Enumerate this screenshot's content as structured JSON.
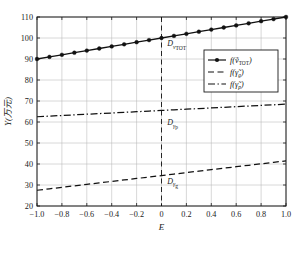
{
  "chart_data": {
    "type": "line",
    "title": "",
    "xlabel": "E",
    "ylabel": "Y(万元)",
    "xlim": [
      -1.0,
      1.0
    ],
    "ylim": [
      20,
      110
    ],
    "grid": true,
    "legend_position": "upper-right",
    "x_ticks": [
      "−1.0",
      "−0.8",
      "−0.6",
      "−0.4",
      "−0.2",
      "0",
      "0.2",
      "0.4",
      "0.6",
      "0.8",
      "1.0"
    ],
    "x_tick_values": [
      -1.0,
      -0.8,
      -0.6,
      -0.4,
      -0.2,
      0,
      0.2,
      0.4,
      0.6,
      0.8,
      1.0
    ],
    "y_ticks": [
      "20",
      "30",
      "40",
      "50",
      "60",
      "70",
      "80",
      "90",
      "100",
      "110"
    ],
    "y_tick_values": [
      20,
      30,
      40,
      50,
      60,
      70,
      80,
      90,
      100,
      110
    ],
    "x": [
      -1.0,
      -0.9,
      -0.8,
      -0.7,
      -0.6,
      -0.5,
      -0.4,
      -0.3,
      -0.2,
      -0.1,
      0.0,
      0.1,
      0.2,
      0.3,
      0.4,
      0.5,
      0.6,
      0.7,
      0.8,
      0.9,
      1.0
    ],
    "series": [
      {
        "name": "f(ṽ_TOT)",
        "style": "solid-with-markers",
        "marker": "filled-circle",
        "values": [
          90.0,
          91.0,
          92.0,
          93.0,
          94.0,
          95.0,
          96.0,
          97.0,
          98.0,
          99.0,
          100.0,
          101.0,
          102.0,
          103.0,
          104.0,
          105.0,
          106.0,
          107.0,
          108.0,
          109.0,
          110.0
        ]
      },
      {
        "name": "f(γ̃_g)",
        "style": "dashed",
        "marker": "none",
        "values": [
          27.5,
          28.2,
          28.9,
          29.6,
          30.3,
          31.0,
          31.7,
          32.4,
          33.1,
          33.8,
          34.5,
          35.2,
          35.9,
          36.6,
          37.3,
          38.0,
          38.7,
          39.4,
          40.1,
          40.8,
          41.5
        ]
      },
      {
        "name": "f(γ̃_p)",
        "style": "dash-dot",
        "marker": "none",
        "values": [
          62.5,
          62.8,
          63.1,
          63.4,
          63.7,
          64.0,
          64.3,
          64.6,
          64.9,
          65.2,
          65.5,
          65.8,
          66.1,
          66.4,
          66.7,
          67.0,
          67.3,
          67.6,
          67.9,
          68.2,
          68.5
        ]
      }
    ],
    "reference_line": {
      "name": "E-zero-line",
      "x": 0,
      "style": "dashed"
    },
    "annotations": [
      {
        "name": "D-v-TOT",
        "base": "D",
        "sub_italic": "v",
        "sub_plain": "TOT",
        "x": 0.03,
        "y": 96.0
      },
      {
        "name": "D-gamma-p",
        "base": "D",
        "sub_italic": "γ",
        "sub_plain": "p",
        "x": 0.03,
        "y": 58.5
      },
      {
        "name": "D-gamma-g",
        "base": "D",
        "sub_italic": "γ",
        "sub_plain": "g",
        "x": 0.03,
        "y": 30.5
      }
    ],
    "legend": [
      {
        "label_base": "f(",
        "var": "ṽ",
        "sub": "TOT",
        "close": ")",
        "style": "solid-with-markers"
      },
      {
        "label_base": "f(",
        "var": "γ̃",
        "sub": "g",
        "close": ")",
        "style": "dashed"
      },
      {
        "label_base": "f(",
        "var": "γ̃",
        "sub": "p",
        "close": ")",
        "style": "dash-dot"
      }
    ],
    "colors": {
      "line": "#111111",
      "grid": "#b8b8b8",
      "axis": "#1a1a1a",
      "background": "#ffffff"
    }
  }
}
